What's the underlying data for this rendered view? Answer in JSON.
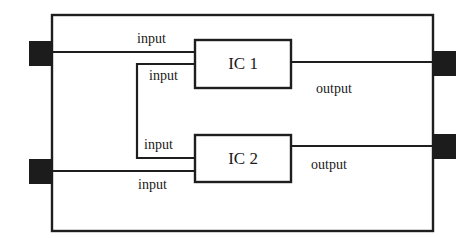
{
  "diagram": {
    "type": "block-diagram",
    "colors": {
      "line": "#1e1e1e",
      "port_fill": "#1c1c1c",
      "background": "#ffffff"
    },
    "components": [
      {
        "id": "ic1",
        "label": "IC 1"
      },
      {
        "id": "ic2",
        "label": "IC 2"
      }
    ],
    "ports": {
      "left": [
        {
          "id": "left-port-1",
          "connects_to": "ic1",
          "role": "input"
        },
        {
          "id": "left-port-2",
          "connects_to": "ic2",
          "role": "input"
        }
      ],
      "right": [
        {
          "id": "right-port-1",
          "connects_from": "ic1",
          "role": "output"
        },
        {
          "id": "right-port-2",
          "connects_from": "ic2",
          "role": "output"
        }
      ]
    },
    "labels": {
      "ic1_top_input": "input",
      "ic1_loop_input": "input",
      "ic2_loop_input": "input",
      "ic2_bottom_input": "input",
      "ic1_output": "output",
      "ic2_output": "output"
    },
    "connections": [
      {
        "from": "left-port-1",
        "to": "ic1",
        "label": "input"
      },
      {
        "from": "ic2",
        "to": "ic1",
        "label": "input",
        "note": "loop between IC 1 and IC 2 inputs"
      },
      {
        "from": "left-port-2",
        "to": "ic2",
        "label": "input"
      },
      {
        "from": "ic1",
        "to": "right-port-1",
        "label": "output"
      },
      {
        "from": "ic2",
        "to": "right-port-2",
        "label": "output"
      }
    ]
  }
}
